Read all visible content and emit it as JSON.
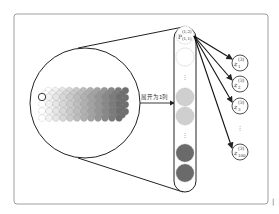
{
  "diagram": {
    "frame": {
      "stroke": "#777777",
      "background": "#ffffff"
    },
    "grid": {
      "rows": 4,
      "cols": 12,
      "depth_layers": 3,
      "color_start": "#ffffff",
      "color_end": "#6e6e6e",
      "highlight_first": true
    },
    "arrow_label": "展开为1列",
    "column": {
      "top_node": {
        "base": "P",
        "superscript": "(1,2)",
        "subscript": "(1,1)"
      },
      "nodes": [
        {
          "fill": "#ffffff",
          "kind": "top"
        },
        {
          "fill": "#ffffff",
          "kind": "circle"
        },
        {
          "kind": "ellipsis"
        },
        {
          "fill": "#cfcfcf",
          "kind": "circle"
        },
        {
          "fill": "#cfcfcf",
          "kind": "circle"
        },
        {
          "kind": "ellipsis"
        },
        {
          "fill": "#6a6a6a",
          "kind": "circle"
        },
        {
          "fill": "#6a6a6a",
          "kind": "circle"
        }
      ],
      "ellipsis": "⋮"
    },
    "outputs": [
      {
        "base": "z",
        "superscript": "(3)",
        "subscript": "1"
      },
      {
        "base": "z",
        "superscript": "(3)",
        "subscript": "2"
      },
      {
        "base": "z",
        "superscript": "(3)",
        "subscript": "3"
      },
      {
        "kind": "ellipsis",
        "text": "⋮"
      },
      {
        "base": "z",
        "superscript": "(3)",
        "subscript": "100"
      }
    ],
    "corner_mark": "|"
  }
}
